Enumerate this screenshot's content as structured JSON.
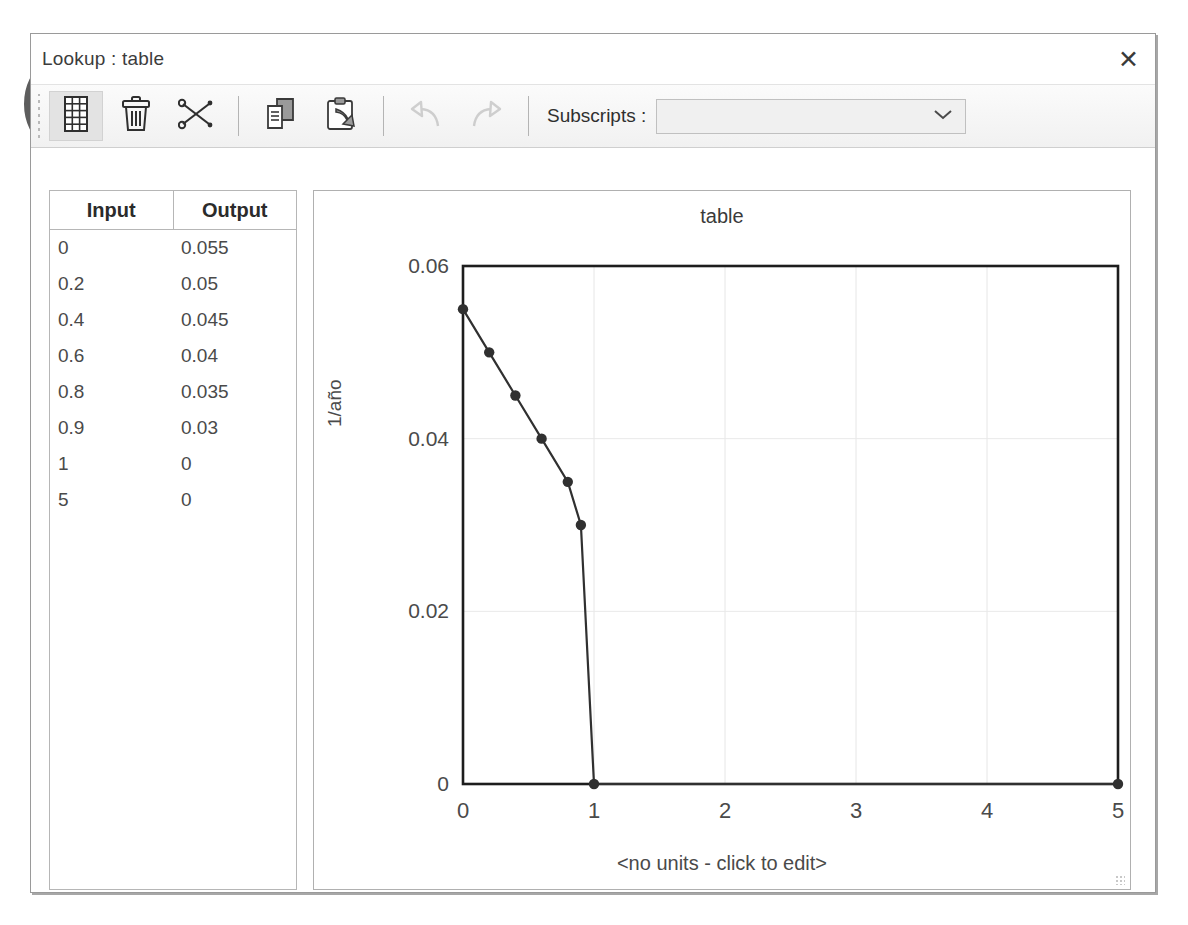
{
  "window": {
    "title": "Lookup : table",
    "close_icon": "close-icon"
  },
  "toolbar": {
    "buttons": [
      {
        "name": "table-grid-button",
        "icon": "table-grid-icon",
        "selected": true,
        "enabled": true
      },
      {
        "name": "delete-button",
        "icon": "trash-icon",
        "selected": false,
        "enabled": true
      },
      {
        "name": "cut-button",
        "icon": "scissors-icon",
        "selected": false,
        "enabled": true
      },
      {
        "name": "copy-button",
        "icon": "copy-icon",
        "selected": false,
        "enabled": true
      },
      {
        "name": "paste-button",
        "icon": "paste-icon",
        "selected": false,
        "enabled": true
      },
      {
        "name": "undo-button",
        "icon": "undo-arrow-icon",
        "selected": false,
        "enabled": false
      },
      {
        "name": "redo-button",
        "icon": "redo-arrow-icon",
        "selected": false,
        "enabled": false
      }
    ],
    "subscripts_label": "Subscripts :",
    "subscripts_value": "",
    "subscripts_placeholder": "",
    "dropdown_icon": "chevron-down-icon"
  },
  "table": {
    "columns": [
      "Input",
      "Output"
    ],
    "rows": [
      [
        "0",
        "0.055"
      ],
      [
        "0.2",
        "0.05"
      ],
      [
        "0.4",
        "0.045"
      ],
      [
        "0.6",
        "0.04"
      ],
      [
        "0.8",
        "0.035"
      ],
      [
        "0.9",
        "0.03"
      ],
      [
        "1",
        "0"
      ],
      [
        "5",
        "0"
      ]
    ]
  },
  "chart_data": {
    "type": "line",
    "title": "table",
    "xlabel": "<no units - click to edit>",
    "ylabel": "1/año",
    "x": [
      0,
      0.2,
      0.4,
      0.6,
      0.8,
      0.9,
      1,
      5
    ],
    "y": [
      0.055,
      0.05,
      0.045,
      0.04,
      0.035,
      0.03,
      0,
      0
    ],
    "xlim": [
      0,
      5
    ],
    "ylim": [
      0,
      0.06
    ],
    "xticks": [
      "0",
      "1",
      "2",
      "3",
      "4",
      "5"
    ],
    "xtick_values": [
      0,
      1,
      2,
      3,
      4,
      5
    ],
    "yticks": [
      "0",
      "0.02",
      "0.04",
      "0.06"
    ],
    "ytick_values": [
      0,
      0.02,
      0.04,
      0.06
    ],
    "grid": true,
    "legend": false,
    "marker": "circle",
    "line_color": "#303030",
    "marker_color": "#303030"
  },
  "annotation": {
    "shape": "hand-drawn-ellipse",
    "color": "#555555"
  }
}
